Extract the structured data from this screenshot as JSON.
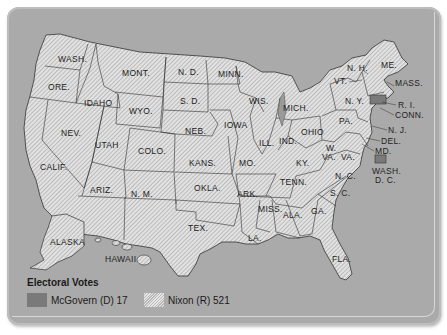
{
  "map": {
    "title": "1972 Presidential Election Electoral Map",
    "background_color": "#aaaaaa",
    "republican_fill": "hatched",
    "democrat_fill": "#7a7a7a",
    "states": [
      {
        "abbr": "WASH.",
        "winner": "Nixon"
      },
      {
        "abbr": "ORE.",
        "winner": "Nixon"
      },
      {
        "abbr": "CALIF.",
        "winner": "Nixon"
      },
      {
        "abbr": "NEV.",
        "winner": "Nixon"
      },
      {
        "abbr": "IDAHO",
        "winner": "Nixon"
      },
      {
        "abbr": "MONT.",
        "winner": "Nixon"
      },
      {
        "abbr": "WYO.",
        "winner": "Nixon"
      },
      {
        "abbr": "UTAH",
        "winner": "Nixon"
      },
      {
        "abbr": "COLO.",
        "winner": "Nixon"
      },
      {
        "abbr": "ARIZ.",
        "winner": "Nixon"
      },
      {
        "abbr": "N. M.",
        "winner": "Nixon"
      },
      {
        "abbr": "N. D.",
        "winner": "Nixon"
      },
      {
        "abbr": "S. D.",
        "winner": "Nixon"
      },
      {
        "abbr": "NEB.",
        "winner": "Nixon"
      },
      {
        "abbr": "KANS.",
        "winner": "Nixon"
      },
      {
        "abbr": "OKLA.",
        "winner": "Nixon"
      },
      {
        "abbr": "TEX.",
        "winner": "Nixon"
      },
      {
        "abbr": "MINN.",
        "winner": "Nixon"
      },
      {
        "abbr": "IOWA",
        "winner": "Nixon"
      },
      {
        "abbr": "MO.",
        "winner": "Nixon"
      },
      {
        "abbr": "ARK.",
        "winner": "Nixon"
      },
      {
        "abbr": "LA.",
        "winner": "Nixon"
      },
      {
        "abbr": "WIS.",
        "winner": "Nixon"
      },
      {
        "abbr": "ILL.",
        "winner": "Nixon"
      },
      {
        "abbr": "MICH.",
        "winner": "Nixon"
      },
      {
        "abbr": "IND.",
        "winner": "Nixon"
      },
      {
        "abbr": "OHIO",
        "winner": "Nixon"
      },
      {
        "abbr": "KY.",
        "winner": "Nixon"
      },
      {
        "abbr": "TENN.",
        "winner": "Nixon"
      },
      {
        "abbr": "MISS.",
        "winner": "Nixon"
      },
      {
        "abbr": "ALA.",
        "winner": "Nixon"
      },
      {
        "abbr": "GA.",
        "winner": "Nixon"
      },
      {
        "abbr": "FLA.",
        "winner": "Nixon"
      },
      {
        "abbr": "S. C.",
        "winner": "Nixon"
      },
      {
        "abbr": "N. C.",
        "winner": "Nixon"
      },
      {
        "abbr": "VA.",
        "winner": "Nixon"
      },
      {
        "abbr": "W. VA.",
        "winner": "Nixon"
      },
      {
        "abbr": "PA.",
        "winner": "Nixon"
      },
      {
        "abbr": "N. Y.",
        "winner": "Nixon"
      },
      {
        "abbr": "VT.",
        "winner": "Nixon"
      },
      {
        "abbr": "N. H.",
        "winner": "Nixon"
      },
      {
        "abbr": "ME.",
        "winner": "Nixon"
      },
      {
        "abbr": "MASS.",
        "winner": "McGovern"
      },
      {
        "abbr": "R. I.",
        "winner": "Nixon"
      },
      {
        "abbr": "CONN.",
        "winner": "Nixon"
      },
      {
        "abbr": "N. J.",
        "winner": "Nixon"
      },
      {
        "abbr": "DEL.",
        "winner": "Nixon"
      },
      {
        "abbr": "MD.",
        "winner": "Nixon"
      },
      {
        "abbr": "WASH. D. C.",
        "winner": "McGovern"
      },
      {
        "abbr": "ALASKA",
        "winner": "Nixon"
      },
      {
        "abbr": "HAWAII",
        "winner": "Nixon"
      }
    ],
    "labels": {
      "wash": "WASH.",
      "ore": "ORE.",
      "calif": "CALIF.",
      "nev": "NEV.",
      "idaho": "IDAHO",
      "mont": "MONT.",
      "wyo": "WYO.",
      "utah": "UTAH",
      "colo": "COLO.",
      "ariz": "ARIZ.",
      "nm": "N. M.",
      "nd": "N. D.",
      "sd": "S. D.",
      "neb": "NEB.",
      "kans": "KANS.",
      "okla": "OKLA.",
      "tex": "TEX.",
      "minn": "MINN.",
      "iowa": "IOWA",
      "mo": "MO.",
      "ark": "ARK.",
      "la": "LA.",
      "wis": "WIS.",
      "ill": "ILL.",
      "mich": "MICH.",
      "ind": "IND.",
      "ohio": "OHIO",
      "ky": "KY.",
      "tenn": "TENN.",
      "miss": "MISS.",
      "ala": "ALA.",
      "ga": "GA.",
      "fla": "FLA.",
      "sc": "S. C.",
      "nc": "N. C.",
      "va": "VA.",
      "wva1": "W.",
      "wva2": "VA.",
      "pa": "PA.",
      "ny": "N. Y.",
      "vt": "VT.",
      "nh": "N. H.",
      "me": "ME.",
      "mass": "MASS.",
      "ri": "R. I.",
      "conn": "CONN.",
      "nj": "N. J.",
      "del": "DEL.",
      "md": "MD.",
      "dc1": "WASH.",
      "dc2": "D. C.",
      "alaska": "ALASKA",
      "hawaii": "HAWAII"
    }
  },
  "legend": {
    "title": "Electoral Votes",
    "items": [
      {
        "label": "McGovern (D) 17",
        "candidate": "McGovern",
        "party": "D",
        "votes": 17,
        "color": "#7a7a7a"
      },
      {
        "label": "Nixon (R) 521",
        "candidate": "Nixon",
        "party": "R",
        "votes": 521,
        "pattern": "hatched"
      }
    ]
  }
}
